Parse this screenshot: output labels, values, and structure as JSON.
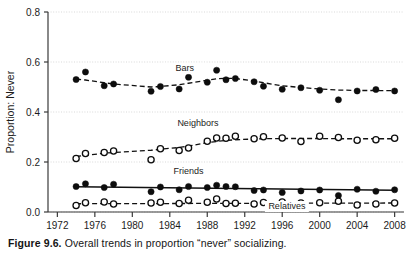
{
  "figure": {
    "caption_label": "Figure 9.6.",
    "caption_text": " Overall trends in proportion “never” socializing."
  },
  "chart_data": {
    "type": "scatter",
    "title": "",
    "xlabel": "",
    "ylabel": "Proportion: Never",
    "xlim": [
      1971,
      2009
    ],
    "ylim": [
      0.0,
      0.8
    ],
    "grid": true,
    "legend_position": "inline-labels",
    "xticks": [
      1972,
      1976,
      1980,
      1984,
      1988,
      1992,
      1996,
      2000,
      2004,
      2008
    ],
    "xtick_labels": [
      "1972",
      "1976",
      "1980",
      "1984",
      "1988",
      "1992",
      "1996",
      "2000",
      "2004",
      "2008"
    ],
    "yticks": [
      0.0,
      0.2,
      0.4,
      0.6,
      0.8
    ],
    "ytick_labels": [
      "0.0",
      "0.2",
      "0.4",
      "0.6",
      "0.8"
    ],
    "series": [
      {
        "name": "Bars",
        "marker": "filled-circle",
        "line_style": "dashed",
        "label_x": 1985.6,
        "label_y": 0.565,
        "x": [
          1974,
          1975,
          1977,
          1978,
          1982,
          1983,
          1985,
          1986,
          1988,
          1989,
          1990,
          1991,
          1993,
          1994,
          1996,
          1998,
          2000,
          2002,
          2004,
          2006,
          2008
        ],
        "y": [
          0.53,
          0.56,
          0.505,
          0.512,
          0.483,
          0.502,
          0.492,
          0.539,
          0.519,
          0.567,
          0.529,
          0.534,
          0.521,
          0.503,
          0.491,
          0.497,
          0.487,
          0.449,
          0.484,
          0.49,
          0.484
        ],
        "trend_x": [
          1974,
          1975,
          1977,
          1978,
          1982,
          1983,
          1985,
          1986,
          1988,
          1989,
          1990,
          1991,
          1993,
          1994,
          1996,
          1998,
          2000,
          2002,
          2004,
          2006,
          2008
        ],
        "trend_y": [
          0.532,
          0.528,
          0.517,
          0.512,
          0.5,
          0.502,
          0.509,
          0.515,
          0.527,
          0.533,
          0.535,
          0.534,
          0.524,
          0.517,
          0.505,
          0.498,
          0.492,
          0.488,
          0.486,
          0.486,
          0.485
        ]
      },
      {
        "name": "Neighbors",
        "marker": "open-circle",
        "line_style": "dashed",
        "label_x": 1987.0,
        "label_y": 0.345,
        "x": [
          1974,
          1975,
          1977,
          1978,
          1982,
          1983,
          1985,
          1986,
          1988,
          1989,
          1990,
          1991,
          1993,
          1994,
          1996,
          1998,
          2000,
          2002,
          2004,
          2006,
          2008
        ],
        "y": [
          0.214,
          0.234,
          0.238,
          0.244,
          0.209,
          0.253,
          0.246,
          0.256,
          0.283,
          0.296,
          0.295,
          0.303,
          0.293,
          0.301,
          0.296,
          0.282,
          0.303,
          0.298,
          0.287,
          0.289,
          0.295
        ],
        "trend_x": [
          1974,
          1975,
          1977,
          1978,
          1982,
          1983,
          1985,
          1986,
          1988,
          1989,
          1990,
          1991,
          1993,
          1994,
          1996,
          1998,
          2000,
          2002,
          2004,
          2006,
          2008
        ],
        "trend_y": [
          0.222,
          0.227,
          0.235,
          0.238,
          0.247,
          0.251,
          0.258,
          0.264,
          0.277,
          0.282,
          0.286,
          0.289,
          0.292,
          0.293,
          0.294,
          0.294,
          0.294,
          0.293,
          0.293,
          0.293,
          0.293
        ]
      },
      {
        "name": "Friends",
        "marker": "filled-circle",
        "line_style": "solid",
        "label_x": 1986.0,
        "label_y": 0.152,
        "x": [
          1974,
          1975,
          1977,
          1978,
          1982,
          1983,
          1985,
          1986,
          1988,
          1989,
          1990,
          1991,
          1993,
          1994,
          1996,
          1998,
          2000,
          2002,
          2004,
          2006,
          2008
        ],
        "y": [
          0.102,
          0.113,
          0.098,
          0.111,
          0.081,
          0.1,
          0.089,
          0.102,
          0.098,
          0.107,
          0.102,
          0.101,
          0.086,
          0.088,
          0.078,
          0.084,
          0.088,
          0.066,
          0.091,
          0.083,
          0.089
        ],
        "trend_x": [
          1974,
          2008
        ],
        "trend_y": [
          0.101,
          0.087
        ]
      },
      {
        "name": "Relatives",
        "marker": "open-circle",
        "line_style": "dashed",
        "label_x": 1996.5,
        "label_y": 0.012,
        "x": [
          1974,
          1975,
          1977,
          1978,
          1982,
          1983,
          1985,
          1986,
          1988,
          1989,
          1990,
          1991,
          1993,
          1994,
          1996,
          1998,
          2000,
          2002,
          2004,
          2006,
          2008
        ],
        "y": [
          0.026,
          0.037,
          0.04,
          0.032,
          0.036,
          0.039,
          0.034,
          0.047,
          0.039,
          0.052,
          0.034,
          0.035,
          0.032,
          0.038,
          0.04,
          0.036,
          0.037,
          0.043,
          0.028,
          0.032,
          0.036
        ],
        "trend_x": [
          1974,
          2008
        ],
        "trend_y": [
          0.033,
          0.036
        ]
      }
    ]
  }
}
